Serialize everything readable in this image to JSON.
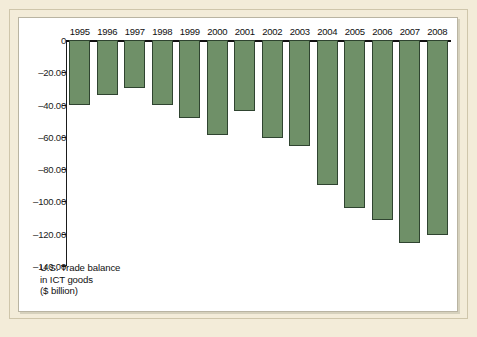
{
  "chart_data": {
    "type": "bar",
    "title": "",
    "caption_lines": [
      "U.S. Trade balance",
      "in ICT goods",
      "($ billion)"
    ],
    "xlabel": "",
    "ylabel": "$ billion",
    "categories": [
      "1995",
      "1996",
      "1997",
      "1998",
      "1999",
      "2000",
      "2001",
      "2002",
      "2003",
      "2004",
      "2005",
      "2006",
      "2007",
      "2008"
    ],
    "values": [
      -40.0,
      -34.0,
      -30.0,
      -40.5,
      -48.5,
      -59.0,
      -44.0,
      -61.0,
      -65.5,
      -90.0,
      -104.0,
      -111.5,
      -126.0,
      -120.5
    ],
    "ylim": [
      -140,
      0
    ],
    "ytick_labels": [
      "0",
      "–20.00",
      "–40.00",
      "–60.00",
      "–80.00",
      "–100.00",
      "–120.00",
      "–140.00"
    ],
    "ytick_values": [
      0,
      -20,
      -40,
      -60,
      -80,
      -100,
      -120,
      -140
    ],
    "grid": false,
    "legend": "none",
    "bar_color": "#6f9068",
    "bar_border_color": "#2f4430",
    "axis_color": "#1b1b1b",
    "plot_background": "#ffffff",
    "frame_background": "#f3ecd9"
  }
}
